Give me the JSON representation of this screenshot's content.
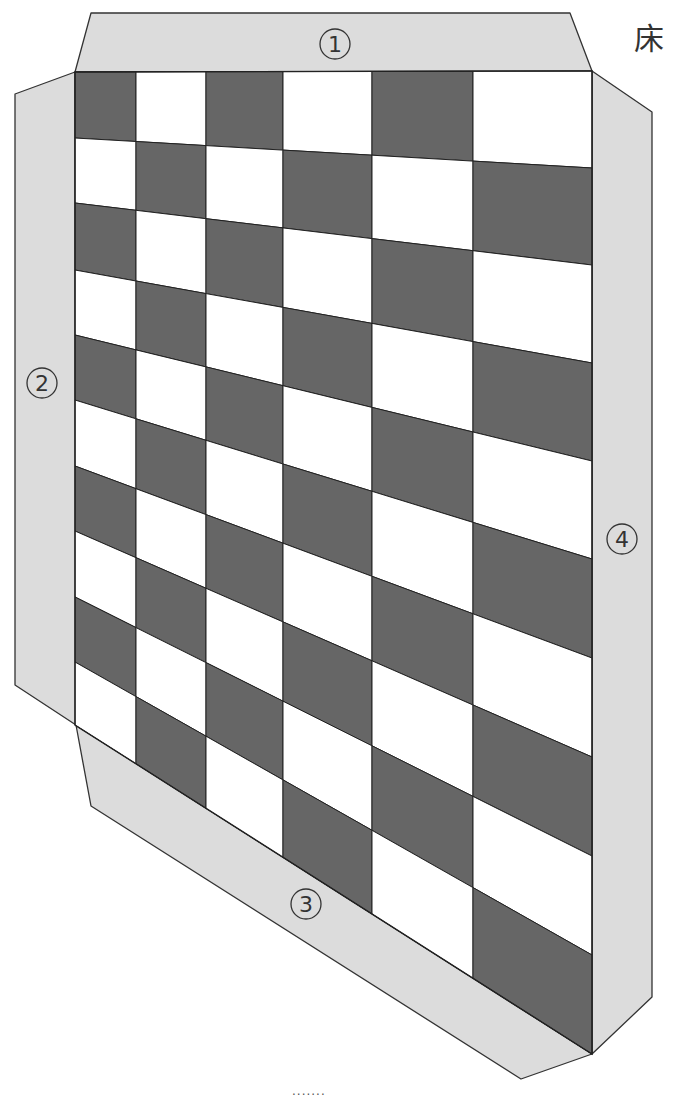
{
  "title": "床",
  "footer_dots": ".......",
  "colors": {
    "dark_cell": "#666666",
    "light_cell": "#ffffff",
    "flap": "#dcdcdc",
    "stroke": "#222222"
  },
  "board": {
    "columns": 6,
    "rows": 10,
    "first_cell": "dark",
    "column_x": [
      75,
      136,
      206,
      283,
      372,
      473,
      592
    ],
    "left_edge_row_y": [
      72,
      138,
      203,
      270,
      335,
      400,
      466,
      531,
      597,
      662,
      725
    ],
    "right_edge_row_y": [
      71,
      168,
      265,
      363,
      461,
      559,
      658,
      757,
      856,
      955,
      1054
    ]
  },
  "flaps": [
    {
      "id": "1",
      "label": "①",
      "points": [
        [
          91,
          13
        ],
        [
          570,
          13
        ],
        [
          592,
          71
        ],
        [
          75,
          72
        ]
      ],
      "label_pos": [
        335,
        44
      ]
    },
    {
      "id": "2",
      "label": "②",
      "points": [
        [
          75,
          72
        ],
        [
          15,
          94
        ],
        [
          15,
          685
        ],
        [
          76,
          725
        ]
      ],
      "label_pos": [
        42,
        383
      ]
    },
    {
      "id": "3",
      "label": "③",
      "points": [
        [
          76,
          725
        ],
        [
          91,
          806
        ],
        [
          521,
          1079
        ],
        [
          592,
          1054
        ]
      ],
      "label_pos": [
        306,
        904
      ]
    },
    {
      "id": "4",
      "label": "④",
      "points": [
        [
          592,
          71
        ],
        [
          652,
          112
        ],
        [
          652,
          997
        ],
        [
          592,
          1054
        ]
      ],
      "label_pos": [
        622,
        539
      ]
    }
  ]
}
